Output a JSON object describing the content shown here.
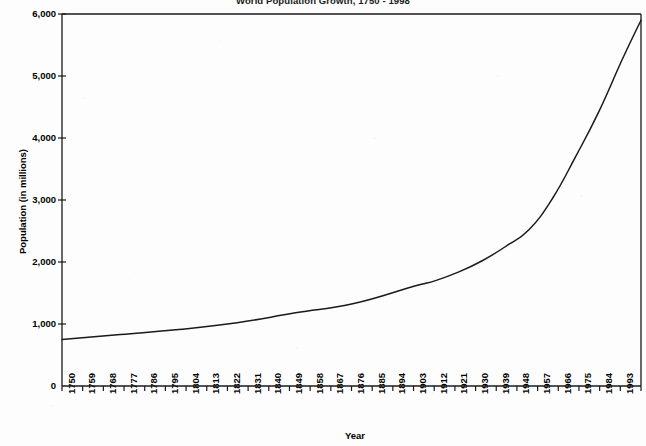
{
  "chart_data": {
    "type": "line",
    "title": "World Population Growth, 1750 - 1998",
    "xlabel": "Year",
    "ylabel": "Population (in millions)",
    "xlim": [
      1750,
      1998
    ],
    "ylim": [
      0,
      6000
    ],
    "grid": false,
    "legend": "none",
    "y_ticks": [
      0,
      1000,
      2000,
      3000,
      4000,
      5000,
      6000
    ],
    "y_tick_labels": [
      "0",
      "1,000",
      "2,000",
      "3,000",
      "4,000",
      "5,000",
      "6,000"
    ],
    "x_tick_labels": [
      "1750",
      "1759",
      "1768",
      "1777",
      "1786",
      "1795",
      "1804",
      "1813",
      "1822",
      "1831",
      "1840",
      "1849",
      "1858",
      "1867",
      "1876",
      "1885",
      "1894",
      "1903",
      "1912",
      "1921",
      "1930",
      "1939",
      "1948",
      "1957",
      "1966",
      "1975",
      "1984",
      "1993"
    ],
    "line_color": "#1a1a1a",
    "series": [
      {
        "name": "World population",
        "x": [
          1750,
          1775,
          1800,
          1825,
          1850,
          1875,
          1900,
          1910,
          1920,
          1930,
          1940,
          1950,
          1960,
          1970,
          1980,
          1990,
          1998
        ],
        "values": [
          750,
          830,
          910,
          1020,
          1180,
          1330,
          1600,
          1700,
          1840,
          2020,
          2250,
          2520,
          3020,
          3700,
          4430,
          5270,
          5900
        ]
      }
    ]
  },
  "axis": {
    "title_text": "World Population Growth, 1750 - 1998",
    "y_title": "Population (in millions)",
    "x_title": "Year"
  }
}
